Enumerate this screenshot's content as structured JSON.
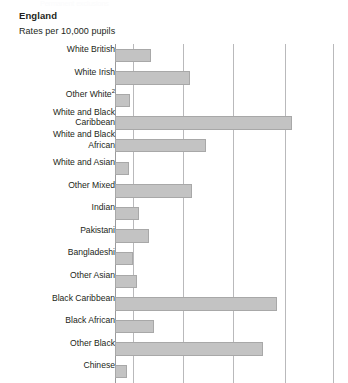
{
  "header": {
    "region_title": "England",
    "units_label": "Rates per 10,000 pupils",
    "clipped_top_text": "Permanent exclusions"
  },
  "chart_data": {
    "type": "bar",
    "orientation": "horizontal",
    "title": "England",
    "subtitle": "Rates per 10,000 pupils",
    "xlabel": "",
    "ylabel": "",
    "xlim": [
      0,
      46
    ],
    "grid": true,
    "gridlines_x": [
      0,
      8,
      18,
      28,
      38,
      46
    ],
    "legend": "none",
    "bar_color": "#c3c3c3",
    "bar_border_color": "#a8a8a8",
    "categories": [
      "White British",
      "White Irish",
      "Other White",
      "White and Black Caribbean",
      "White and Black African",
      "White and Asian",
      "Other Mixed",
      "Indian",
      "Pakistani",
      "Bangladeshi",
      "Other Asian",
      "Black Caribbean",
      "Black African",
      "Other Black",
      "Chinese"
    ],
    "values": [
      15,
      23,
      6,
      36,
      27,
      5,
      24,
      5,
      8,
      5,
      3,
      33,
      12,
      31,
      3
    ],
    "notes": {
      "other_white_superscript": "2"
    }
  },
  "rows": [
    {
      "label": "White British",
      "value": 15,
      "bar_px": 36,
      "two_line": false
    },
    {
      "label": "White Irish",
      "value": 23,
      "bar_px": 75,
      "two_line": false
    },
    {
      "label": "Other White",
      "value": 6,
      "bar_px": 15,
      "two_line": false,
      "superscript": "2"
    },
    {
      "label": "White and Black\nCaribbean",
      "value": 36,
      "bar_px": 177,
      "two_line": true
    },
    {
      "label": "White and Black\nAfrican",
      "value": 27,
      "bar_px": 91,
      "two_line": true
    },
    {
      "label": "White and Asian",
      "value": 5,
      "bar_px": 14,
      "two_line": false
    },
    {
      "label": "Other Mixed",
      "value": 24,
      "bar_px": 77,
      "two_line": false
    },
    {
      "label": "Indian",
      "value": 5,
      "bar_px": 24,
      "two_line": false
    },
    {
      "label": "Pakistani",
      "value": 8,
      "bar_px": 34,
      "two_line": false
    },
    {
      "label": "Bangladeshi",
      "value": 5,
      "bar_px": 18,
      "two_line": false
    },
    {
      "label": "Other Asian",
      "value": 3,
      "bar_px": 22,
      "two_line": false
    },
    {
      "label": "Black Caribbean",
      "value": 33,
      "bar_px": 162,
      "two_line": false
    },
    {
      "label": "Black African",
      "value": 12,
      "bar_px": 39,
      "two_line": false
    },
    {
      "label": "Other Black",
      "value": 31,
      "bar_px": 148,
      "two_line": false
    },
    {
      "label": "Chinese",
      "value": 3,
      "bar_px": 12,
      "two_line": false
    }
  ],
  "gridlines_px": [
    115,
    133,
    183,
    233,
    285,
    333
  ]
}
